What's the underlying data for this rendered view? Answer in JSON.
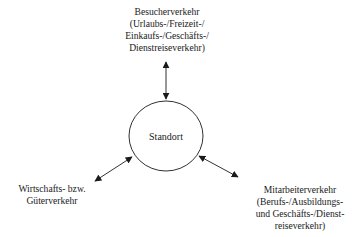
{
  "diagram": {
    "center": {
      "label": "Standort"
    },
    "nodes": {
      "top": {
        "lines": [
          "Besucherverkehr",
          "(Urlaubs-/Freizeit-/",
          "Einkaufs-/Geschäfts-/",
          "Dienstreiseverkehr)"
        ]
      },
      "left": {
        "lines": [
          "Wirtschafts- bzw.",
          "Güterverkehr"
        ]
      },
      "right": {
        "lines": [
          "Mitarbeiterverkehr",
          "(Berufs-/Ausbildungs-",
          "und Geschäfts-/Dienst-",
          "reiseverkehr)"
        ]
      }
    },
    "edges": [
      {
        "from": "center",
        "to": "top",
        "type": "bidirectional-arrow"
      },
      {
        "from": "center",
        "to": "left",
        "type": "bidirectional-arrow"
      },
      {
        "from": "center",
        "to": "right",
        "type": "bidirectional-arrow"
      }
    ],
    "colors": {
      "stroke": "#1a1a1a",
      "background": "#ffffff"
    }
  }
}
